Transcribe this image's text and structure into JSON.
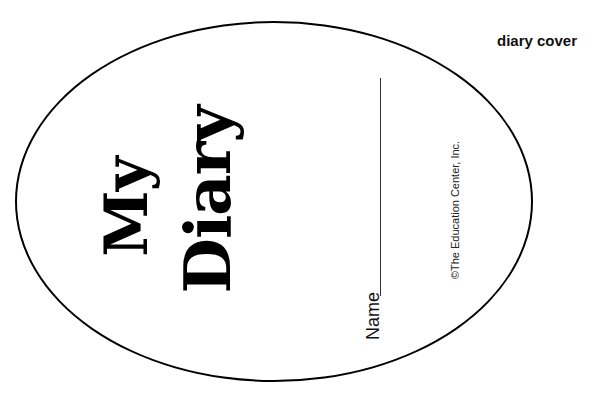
{
  "page": {
    "label": "diary cover"
  },
  "cover": {
    "title_line1": "My",
    "title_line2": "Diary",
    "name_label": "Name",
    "copyright": "©The Education Center, Inc."
  },
  "colors": {
    "outline": "#000000",
    "text": "#000000",
    "background": "#ffffff"
  }
}
